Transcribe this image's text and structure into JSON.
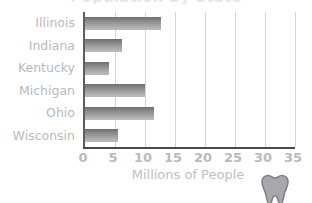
{
  "figure": {
    "clipped_title": "Population by State",
    "watermark_icon": "tooth-logo-icon"
  },
  "chart_data": {
    "type": "bar",
    "orientation": "horizontal",
    "title": "",
    "xlabel": "Millions of People",
    "ylabel": "",
    "categories": [
      "Illinois",
      "Indiana",
      "Kentucky",
      "Michigan",
      "Ohio",
      "Wisconsin"
    ],
    "values": [
      12.6,
      6.2,
      4.0,
      10.0,
      11.5,
      5.5
    ],
    "xlim": [
      0,
      35
    ],
    "xticks": [
      0,
      5,
      10,
      15,
      20,
      25,
      30,
      35
    ],
    "xtick_labels": [
      "0",
      "5",
      "10",
      "15",
      "20",
      "25",
      "30",
      "35"
    ],
    "grid": true,
    "grid_axis": "x",
    "legend": false,
    "bar_color": "#8d8d90",
    "grid_color": "#d3d3d6",
    "axis_color": "#4a4a4a",
    "label_color": "#b9b9bd"
  }
}
